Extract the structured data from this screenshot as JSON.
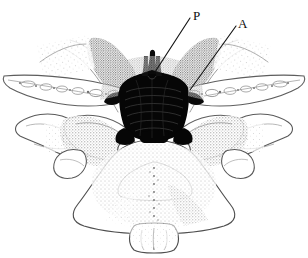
{
  "figure": {
    "kind": "anatomical-line-illustration",
    "style": "stippled pen-and-ink, black on white",
    "width_px": 308,
    "height_px": 258,
    "background_color": "#ffffff",
    "ink_color": "#4a4a4a",
    "dark_mass_color": "#060606",
    "leader_line_color": "#141414",
    "label_color": "#0d0d0d"
  },
  "annotations": [
    {
      "id": "label-p",
      "text": "P",
      "meaning": "posterior",
      "label_x": 193,
      "label_y": 20,
      "leader": {
        "x1": 190,
        "y1": 18,
        "x2": 155,
        "y2": 72
      }
    },
    {
      "id": "label-a",
      "text": "A",
      "meaning": "anterior",
      "label_x": 238,
      "label_y": 28,
      "leader": {
        "x1": 236,
        "y1": 26,
        "x2": 190,
        "y2": 90
      }
    }
  ],
  "structures": [
    {
      "name": "dural-sac-dark-mass",
      "label": "central dark mass"
    },
    {
      "name": "spinous-process",
      "label": "bifid spinous process"
    },
    {
      "name": "vertebral-body",
      "label": "vertebral body"
    },
    {
      "name": "lamina-left",
      "label": "left lamina"
    },
    {
      "name": "lamina-right",
      "label": "right lamina"
    },
    {
      "name": "transverse-process-left",
      "label": "left transverse process"
    },
    {
      "name": "transverse-process-right",
      "label": "right transverse process"
    },
    {
      "name": "nerve-root-sleeve-left",
      "label": "left nerve root sleeve"
    },
    {
      "name": "nerve-root-sleeve-right",
      "label": "right nerve root sleeve"
    },
    {
      "name": "articular-process-left",
      "label": "left articular process"
    },
    {
      "name": "articular-process-right",
      "label": "right articular process"
    }
  ]
}
